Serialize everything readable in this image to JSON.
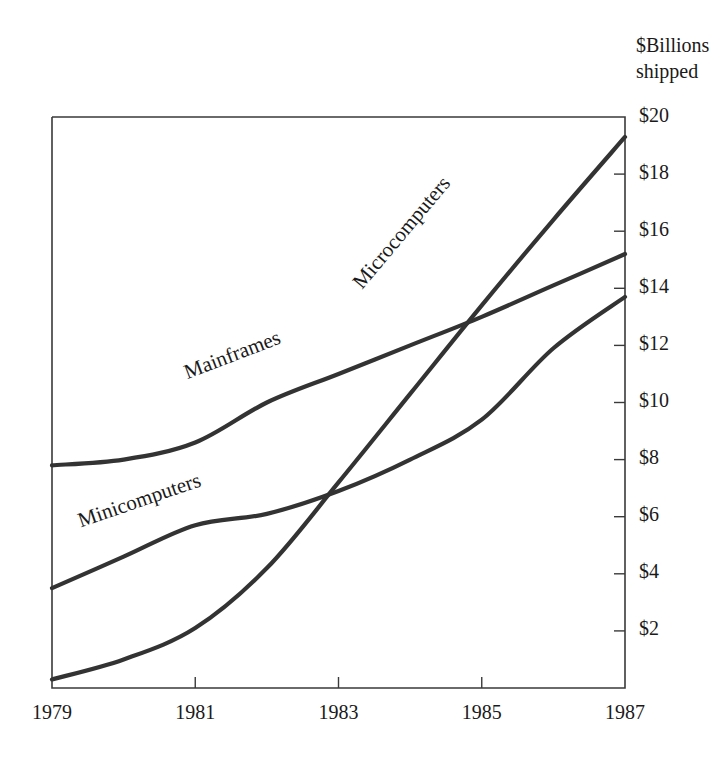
{
  "chart_data": {
    "type": "line",
    "title": "",
    "subtitle": "",
    "axis_title_lines": [
      "$Billions",
      "shipped"
    ],
    "xlabel": "",
    "ylabel": "$Billions shipped",
    "x": [
      1979,
      1980,
      1981,
      1982,
      1983,
      1984,
      1985,
      1986,
      1987
    ],
    "xlim": [
      1979,
      1987
    ],
    "ylim": [
      0,
      20
    ],
    "x_tick_labels": [
      "1979",
      "1981",
      "1983",
      "1985",
      "1987"
    ],
    "x_tick_values": [
      1979,
      1981,
      1983,
      1985,
      1987
    ],
    "y_tick_labels": [
      "$2",
      "$4",
      "$6",
      "$8",
      "$10",
      "$12",
      "$14",
      "$16",
      "$18",
      "$20"
    ],
    "y_tick_values": [
      2,
      4,
      6,
      8,
      10,
      12,
      14,
      16,
      18,
      20
    ],
    "grid": false,
    "legend": "inline-curve-labels",
    "line_color": "#333333",
    "frame_color": "#3a3a3a",
    "series": [
      {
        "name": "Mainframes",
        "label": "Mainframes",
        "values": [
          7.8,
          8.0,
          8.6,
          10.0,
          11.0,
          12.0,
          13.0,
          14.1,
          15.2
        ],
        "label_x": 1981.55,
        "label_y": 11.45,
        "label_rotation": -21
      },
      {
        "name": "Minicomputers",
        "label": "Minicomputers",
        "values": [
          3.5,
          4.6,
          5.7,
          6.1,
          6.9,
          8.0,
          9.4,
          11.9,
          13.7
        ],
        "label_x": 1980.25,
        "label_y": 6.35,
        "label_rotation": -19
      },
      {
        "name": "Microcomputers",
        "label": "Microcomputers",
        "values": [
          0.3,
          1.0,
          2.1,
          4.2,
          7.2,
          10.3,
          13.4,
          16.4,
          19.3
        ],
        "label_x": 1983.95,
        "label_y": 15.8,
        "label_rotation": -50
      }
    ],
    "annotations": []
  }
}
